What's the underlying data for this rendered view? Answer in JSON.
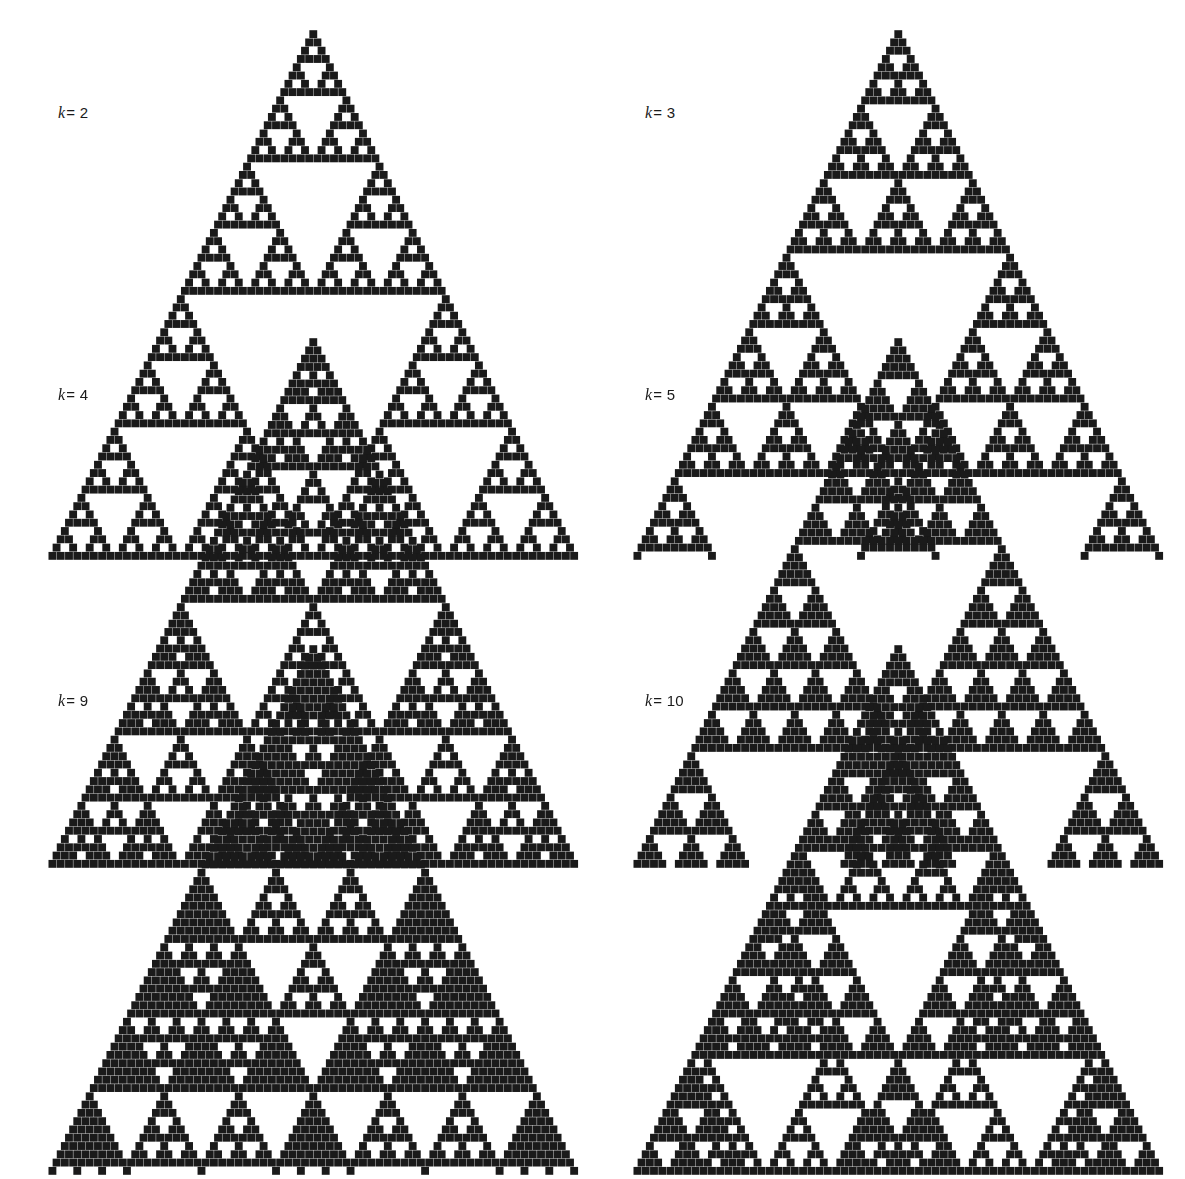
{
  "figure": {
    "type": "pascal-triangle-modulo-grid",
    "background_color": "#ffffff",
    "cell_color": "#1a1a1a",
    "canvas": {
      "width": 1185,
      "height": 948
    },
    "panel_columns": 2,
    "panel_rows": 3,
    "rows_per_triangle": 64
  },
  "panels": [
    {
      "id": "panel-k2",
      "label": "k = 2",
      "label_k": "k",
      "label_eq": "= 2",
      "modulus": 2,
      "label_x": 58,
      "label_y": 112,
      "tri_left": 40,
      "tri_top": 30,
      "tri_width": 530,
      "tri_rows": 64,
      "cell": 4.05,
      "dot": 3.9
    },
    {
      "id": "panel-k3",
      "label": "k = 3",
      "label_k": "k",
      "label_eq": "= 3",
      "modulus": 3,
      "label_x": 645,
      "label_y": 112,
      "tri_left": 625,
      "tri_top": 30,
      "tri_width": 530,
      "tri_rows": 64,
      "cell": 4.05,
      "dot": 3.9
    },
    {
      "id": "panel-k4",
      "label": "k = 4",
      "label_k": "k",
      "label_eq": "= 4",
      "modulus": 4,
      "label_x": 58,
      "label_y": 394,
      "tri_left": 40,
      "tri_top": 338,
      "tri_width": 530,
      "tri_rows": 64,
      "cell": 4.05,
      "dot": 3.9
    },
    {
      "id": "panel-k5",
      "label": "k = 5",
      "label_k": "k",
      "label_eq": "= 5",
      "modulus": 5,
      "label_x": 645,
      "label_y": 394,
      "tri_left": 625,
      "tri_top": 338,
      "tri_width": 530,
      "tri_rows": 64,
      "cell": 4.05,
      "dot": 3.9
    },
    {
      "id": "panel-k9",
      "label": "k = 9",
      "label_k": "k",
      "label_eq": "= 9",
      "modulus": 9,
      "label_x": 58,
      "label_y": 700,
      "tri_left": 40,
      "tri_top": 645,
      "tri_width": 530,
      "tri_rows": 64,
      "cell": 4.05,
      "dot": 3.9
    },
    {
      "id": "panel-k10",
      "label": "k = 10",
      "label_k": "k",
      "label_eq": "= 10",
      "modulus": 10,
      "label_x": 645,
      "label_y": 700,
      "tri_left": 625,
      "tri_top": 645,
      "tri_width": 530,
      "tri_rows": 64,
      "cell": 4.05,
      "dot": 3.9
    }
  ],
  "chart_data": {
    "type": "heatmap",
    "title": "",
    "subtitle": "",
    "xlabel": "",
    "ylabel": "",
    "legend": [],
    "grid": false,
    "moduli": [
      2,
      3,
      4,
      5,
      9,
      10
    ],
    "rows": 64,
    "rule": "fill if C(n,m) mod k != 0",
    "fill_counts_note": "Counts of filled cells for rows 0..63",
    "series": [
      {
        "name": "k = 2",
        "modulus": 2
      },
      {
        "name": "k = 3",
        "modulus": 3
      },
      {
        "name": "k = 4",
        "modulus": 4
      },
      {
        "name": "k = 5",
        "modulus": 5
      },
      {
        "name": "k = 9",
        "modulus": 9
      },
      {
        "name": "k = 10",
        "modulus": 10
      }
    ]
  }
}
